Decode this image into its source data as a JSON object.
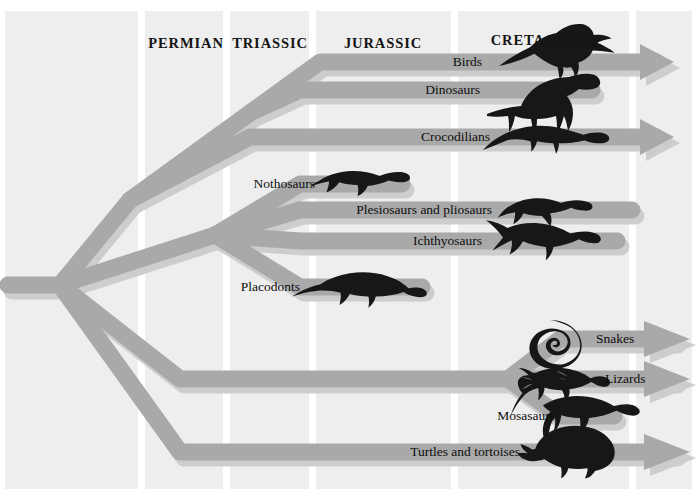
{
  "figure": {
    "kind": "cladogram",
    "background_color": "#ffffff",
    "panel_color": "#eeeeee",
    "branch_color": "#a9a9a9",
    "branch_shadow_color": "#cdcdcd",
    "silhouette_color": "#171717",
    "divider_color": "#ffffff",
    "text_color": "#111111"
  },
  "periods": [
    {
      "name": "PERMIAN",
      "x": 186,
      "y": 43,
      "start": 142,
      "end": 227
    },
    {
      "name": "TRIASSIC",
      "x": 270,
      "y": 43,
      "start": 227,
      "end": 313
    },
    {
      "name": "JURASSIC",
      "x": 383,
      "y": 43,
      "start": 313,
      "end": 455
    },
    {
      "name": "CRETACEOUS",
      "x": 545,
      "y": 40,
      "start": 455,
      "end": 633
    }
  ],
  "dividers": [
    4,
    142,
    227,
    313,
    455,
    633,
    693
  ],
  "taxa": [
    {
      "name": "Birds",
      "label_x": 482,
      "label_y": 62,
      "align": "right",
      "y": 62,
      "terminus": "arrow",
      "end_x": 672,
      "silhouette": "archaeopteryx"
    },
    {
      "name": "Dinosaurs",
      "label_x": 480,
      "label_y": 90,
      "align": "right",
      "y": 90,
      "terminus": "round",
      "end_x": 600,
      "silhouette": "sauropodomorph"
    },
    {
      "name": "Crocodilians",
      "label_x": 490,
      "label_y": 137,
      "align": "right",
      "y": 137,
      "terminus": "arrow",
      "end_x": 672,
      "silhouette": "crocodile"
    },
    {
      "name": "Nothosaurs",
      "label_x": 315,
      "label_y": 184,
      "align": "right",
      "y": 184,
      "terminus": "round",
      "end_x": 410,
      "silhouette": "nothosaur"
    },
    {
      "name": "Plesiosaurs and pliosaurs",
      "label_x": 492,
      "label_y": 210,
      "align": "right",
      "y": 210,
      "terminus": "round",
      "end_x": 640,
      "silhouette": "plesiosaur"
    },
    {
      "name": "Ichthyosaurs",
      "label_x": 482,
      "label_y": 241,
      "align": "right",
      "y": 241,
      "terminus": "round",
      "end_x": 625,
      "silhouette": "ichthyosaur"
    },
    {
      "name": "Placodonts",
      "label_x": 300,
      "label_y": 287,
      "align": "right",
      "y": 287,
      "terminus": "round",
      "end_x": 430,
      "silhouette": "placodont"
    },
    {
      "name": "Snakes",
      "label_x": 596,
      "label_y": 339,
      "align": "left",
      "y": 339,
      "terminus": "arrow",
      "end_x": 690,
      "silhouette": "snake"
    },
    {
      "name": "Lizards",
      "label_x": 605,
      "label_y": 379,
      "align": "left",
      "y": 379,
      "terminus": "arrow",
      "end_x": 690,
      "silhouette": "lizard"
    },
    {
      "name": "Mosasaurs",
      "label_x": 555,
      "label_y": 416,
      "align": "right",
      "y": 416,
      "terminus": "round",
      "end_x": 622,
      "silhouette": "mosasaur"
    },
    {
      "name": "Turtles and tortoises",
      "label_x": 520,
      "label_y": 452,
      "align": "right",
      "y": 452,
      "terminus": "arrow",
      "end_x": 690,
      "silhouette": "turtle"
    }
  ],
  "nodes": [
    {
      "id": "root",
      "x": 8,
      "y": 285
    },
    {
      "id": "amniote",
      "x": 60,
      "y": 285
    },
    {
      "id": "diapsid",
      "x": 130,
      "y": 200
    },
    {
      "id": "archosaur",
      "x": 250,
      "y": 113
    },
    {
      "id": "marine",
      "x": 215,
      "y": 235
    },
    {
      "id": "lepido",
      "x": 508,
      "y": 379
    }
  ]
}
